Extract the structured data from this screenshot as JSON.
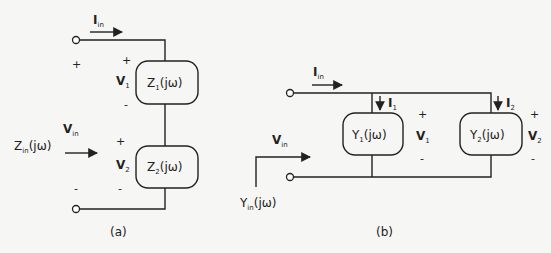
{
  "figure_a": {
    "caption": "(a)",
    "current_label": {
      "main": "I",
      "sub": "in"
    },
    "input_voltage_label": {
      "main": "V",
      "sub": "in"
    },
    "impedance_label": {
      "main": "Z",
      "sub": "in",
      "suffix": "(jω)"
    },
    "terminal_plus": "+",
    "terminal_minus": "-",
    "elements": [
      {
        "name": "Z",
        "sub": "1",
        "suffix": "(jω)",
        "voltage": {
          "main": "V",
          "sub": "1"
        },
        "plus": "+",
        "minus": "-"
      },
      {
        "name": "Z",
        "sub": "2",
        "suffix": "(jω)",
        "voltage": {
          "main": "V",
          "sub": "2"
        },
        "plus": "+",
        "minus": "-"
      }
    ],
    "connection": "series"
  },
  "figure_b": {
    "caption": "(b)",
    "current_label": {
      "main": "I",
      "sub": "in"
    },
    "input_voltage_label": {
      "main": "V",
      "sub": "in"
    },
    "admittance_label": {
      "main": "Y",
      "sub": "in",
      "suffix": "(jω)"
    },
    "elements": [
      {
        "name": "Y",
        "sub": "1",
        "suffix": "(jω)",
        "current": {
          "main": "I",
          "sub": "1"
        },
        "voltage": {
          "main": "V",
          "sub": "1"
        },
        "plus": "+",
        "minus": "-"
      },
      {
        "name": "Y",
        "sub": "2",
        "suffix": "(jω)",
        "current": {
          "main": "I",
          "sub": "2"
        },
        "voltage": {
          "main": "V",
          "sub": "2"
        },
        "plus": "+",
        "minus": "-"
      }
    ],
    "connection": "parallel"
  },
  "colors": {
    "background": "#f6f6f4",
    "ink": "#222222"
  }
}
